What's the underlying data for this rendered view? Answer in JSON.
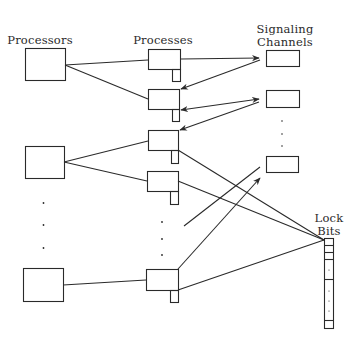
{
  "diagram": {
    "type": "architecture",
    "colors": {
      "stroke": "#2a2a2a",
      "background": "#ffffff"
    },
    "column_headers": {
      "processors": "Processors",
      "processes": "Processes",
      "signaling_channels_line1": "Signaling",
      "signaling_channels_line2": "Channels",
      "lock_bits_line1": "Lock",
      "lock_bits_line2": "Bits"
    },
    "processors": [
      {
        "id": "processor-1"
      },
      {
        "id": "processor-2"
      },
      {
        "id": "processor-n"
      }
    ],
    "processes": [
      {
        "id": "process-1",
        "processor": "processor-1"
      },
      {
        "id": "process-2",
        "processor": "processor-1"
      },
      {
        "id": "process-3",
        "processor": "processor-2"
      },
      {
        "id": "process-4",
        "processor": "processor-2"
      },
      {
        "id": "process-n",
        "processor": "processor-n"
      }
    ],
    "signaling_channels": [
      {
        "id": "channel-1"
      },
      {
        "id": "channel-2"
      },
      {
        "id": "channel-n"
      }
    ],
    "edges": [
      {
        "from": "processor-1",
        "to": "process-1",
        "arrow": false
      },
      {
        "from": "processor-1",
        "to": "process-2",
        "arrow": false
      },
      {
        "from": "processor-2",
        "to": "process-3",
        "arrow": false
      },
      {
        "from": "processor-2",
        "to": "process-4",
        "arrow": false
      },
      {
        "from": "processor-n",
        "to": "process-n",
        "arrow": false
      },
      {
        "from": "process-1",
        "to": "channel-1",
        "arrow": true
      },
      {
        "from": "channel-1",
        "to": "process-2",
        "arrow": true
      },
      {
        "from": "process-2",
        "to": "channel-2",
        "arrow": "both"
      },
      {
        "from": "channel-2",
        "to": "process-3",
        "arrow": true
      },
      {
        "from": "process-ellipsis",
        "to": "channel-n",
        "arrow": false
      },
      {
        "from": "process-n",
        "to": "channel-n",
        "arrow": true
      },
      {
        "from": "process-3",
        "to": "lock-bits",
        "arrow": false
      },
      {
        "from": "process-4",
        "to": "lock-bits",
        "arrow": false
      },
      {
        "from": "process-n",
        "to": "lock-bits",
        "arrow": false
      }
    ],
    "ellipsis": "⋮"
  }
}
